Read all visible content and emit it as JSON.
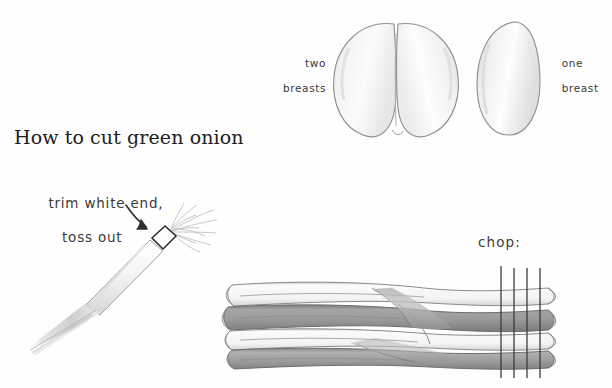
{
  "illustration": {
    "title": "How to cut green onion",
    "medium": "pencil-drawing",
    "background_color": "#ffffff",
    "ink_color": "#3a3a3a"
  },
  "labels": {
    "title": "How to cut green onion",
    "two_breasts": "two\nbreasts",
    "two_breasts_line1": "two",
    "two_breasts_line2": "breasts",
    "one_breast_line1": "one",
    "one_breast_line2": "breast",
    "chop": "chop:",
    "trim_line1": "trim white end,",
    "trim_line2": "toss out"
  },
  "figures": {
    "chicken_breast_double": {
      "name": "two-breasts-drawing",
      "shape": "heart-shaped double lobe",
      "fill": "#f7f7f7",
      "outline": "#8d8d8d"
    },
    "chicken_breast_single": {
      "name": "one-breast-drawing",
      "shape": "elongated oval",
      "fill": "#f6f6f6",
      "outline": "#8d8d8d"
    },
    "single_scallion": {
      "name": "single-green-onion-drawing",
      "orientation": "diagonal",
      "parts": [
        "root-fringe",
        "trim-line-box",
        "white-stem",
        "green-blade"
      ]
    },
    "scallion_bundle": {
      "name": "green-onion-bundle-drawing",
      "band_count": 5,
      "chop_guide_line_count": 4,
      "band_colors": [
        "#f2f2f2",
        "#9a9a9a",
        "#efefef",
        "#8f8f8f",
        "#a6a6a6"
      ]
    }
  },
  "icons": {
    "arrow": "curved-arrow-icon",
    "chop_lines": "chop-guide-lines-icon"
  }
}
